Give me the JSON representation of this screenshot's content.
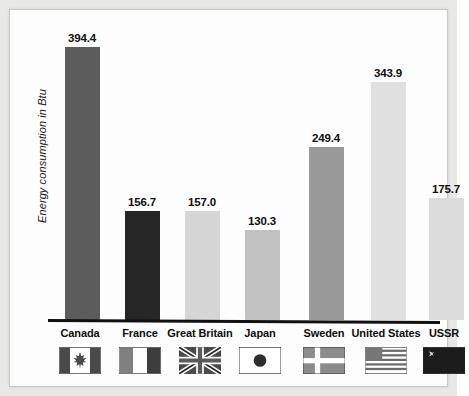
{
  "chart_data": {
    "type": "bar",
    "title": "",
    "subtitle": "",
    "xlabel": "",
    "ylabel": "Energy consumption in Btu",
    "ylim": [
      0,
      430
    ],
    "grid": false,
    "legend": "none",
    "categories": [
      "Canada",
      "France",
      "Great Britain",
      "Japan",
      "Sweden",
      "United States",
      "USSR"
    ],
    "values": [
      394.4,
      156.7,
      157.0,
      130.3,
      249.4,
      343.9,
      175.7
    ],
    "value_labels": [
      "394.4",
      "156.7",
      "157.0",
      "130.3",
      "249.4",
      "343.9",
      "175.7"
    ],
    "bar_colors": [
      "#5c5c5c",
      "#262626",
      "#d6d6d6",
      "#c2c2c2",
      "#999999",
      "#e0e0e0",
      "#dcdcdc"
    ],
    "icons": [
      "flag-canada-icon",
      "flag-france-icon",
      "flag-great-britain-icon",
      "flag-japan-icon",
      "flag-sweden-icon",
      "flag-united-states-icon",
      "flag-ussr-icon"
    ]
  },
  "figure": {
    "background_color": "#e8e8e6",
    "panel_color": "#fdfdfd",
    "axis_color": "#111111",
    "text_color": "#0d0d0d"
  }
}
